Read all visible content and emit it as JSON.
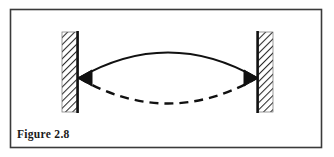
{
  "figure": {
    "caption": "Figure 2.8",
    "border_color": "#3a3a3a",
    "background_color": "#ffffff",
    "ink_color": "#111111",
    "hatch_color": "#2b2b2b"
  },
  "diagram": {
    "type": "vibrating-string-schematic",
    "left_wall": {
      "label": "left-fixed-support",
      "hatched": true,
      "hatch_direction": "lower-left-to-upper-right"
    },
    "right_wall": {
      "label": "right-fixed-support",
      "hatched": true,
      "hatch_direction": "lower-left-to-upper-right"
    },
    "upper_curve": {
      "label": "upper-displacement-curve",
      "style": "solid",
      "bows": "up"
    },
    "lower_curve": {
      "label": "lower-displacement-curve",
      "style": "dashed",
      "bows": "down"
    },
    "arrowheads": {
      "left": "points-left",
      "right": "points-right"
    }
  }
}
